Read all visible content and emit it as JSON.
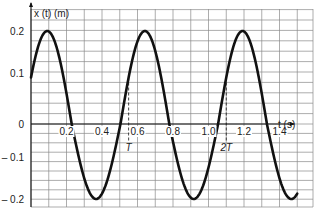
{
  "chart_data": {
    "type": "line",
    "title": "",
    "xlabel": "t (s)",
    "ylabel": "x (t)  (m)",
    "x_ticks": [
      "0.2",
      "0.4",
      "0.6",
      "0.8",
      "1.0",
      "1.2",
      "1.4"
    ],
    "y_ticks": [
      "0.2",
      "0.1",
      "0",
      "– 0.1",
      "– 0.2"
    ],
    "xlim": [
      0,
      1.5
    ],
    "ylim": [
      -0.2,
      0.2
    ],
    "grid": true,
    "annotations": [
      {
        "label": "T",
        "t": 0.55
      },
      {
        "label": "2T",
        "t": 1.1
      }
    ],
    "series": [
      {
        "name": "x(t)",
        "function": "0.2*sin(2*pi*t/0.55 + pi/6)",
        "amplitude": 0.2,
        "period": 0.55,
        "x": [
          0,
          0.05,
          0.083,
          0.1,
          0.15,
          0.2,
          0.25,
          0.3,
          0.358,
          0.4,
          0.45,
          0.5,
          0.55,
          0.6,
          0.633,
          0.65,
          0.7,
          0.75,
          0.8,
          0.85,
          0.908,
          0.95,
          1.0,
          1.05,
          1.1,
          1.15,
          1.183,
          1.2,
          1.25,
          1.3,
          1.35,
          1.4,
          1.458,
          1.5
        ],
        "values": [
          0.1,
          0.183,
          0.2,
          0.198,
          0.157,
          0.08,
          -0.015,
          -0.107,
          -0.2,
          -0.182,
          -0.124,
          -0.046,
          0.1,
          0.177,
          0.2,
          0.199,
          0.169,
          0.098,
          0.005,
          -0.088,
          -0.2,
          -0.19,
          -0.141,
          -0.065,
          0.1,
          0.171,
          0.2,
          0.199,
          0.177,
          0.114,
          0.025,
          -0.069,
          -0.2,
          -0.184
        ]
      }
    ]
  },
  "labels": {
    "y_axis_title": "x (t)  (m)",
    "x_axis_title": "t (s)",
    "period_marker": "T",
    "double_period_marker": "2T"
  }
}
